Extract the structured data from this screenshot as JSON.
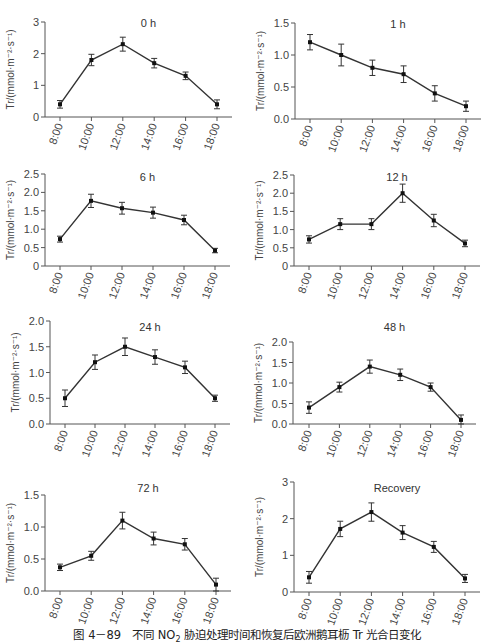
{
  "caption": {
    "prefix": "图 4－89",
    "text_before_sub": "不同 NO",
    "sub": "2",
    "text_after_sub": " 胁迫处理时间和恢复后欧洲鹅耳枥 Tr 光合日变化"
  },
  "style": {
    "line_color": "#333333",
    "axis_color": "#555555",
    "tick_label_color": "#444444"
  },
  "chart_data": [
    {
      "type": "line",
      "title": "0 h",
      "xlabel": "",
      "ylabel": "Tr/(mmol·m⁻²·s⁻¹)",
      "categories": [
        "8:00",
        "10:00",
        "12:00",
        "14:00",
        "16:00",
        "18:00"
      ],
      "values": [
        0.4,
        1.8,
        2.3,
        1.7,
        1.3,
        0.4
      ],
      "errors": [
        0.12,
        0.18,
        0.22,
        0.15,
        0.12,
        0.14
      ],
      "ylim": [
        0,
        3
      ],
      "yticks": [
        "0",
        "1",
        "2",
        "3"
      ],
      "grid": false
    },
    {
      "type": "line",
      "title": "1 h",
      "xlabel": "",
      "ylabel": "Tr/(mmol·m⁻²·s⁻¹)",
      "categories": [
        "8:00",
        "10:00",
        "12:00",
        "14:00",
        "16:00",
        "18:00"
      ],
      "values": [
        1.2,
        1.0,
        0.8,
        0.7,
        0.4,
        0.2
      ],
      "errors": [
        0.12,
        0.17,
        0.12,
        0.13,
        0.12,
        0.08
      ],
      "ylim": [
        0,
        1.5
      ],
      "yticks": [
        "0.0",
        "0.5",
        "1.0",
        "1.5"
      ],
      "grid": false
    },
    {
      "type": "line",
      "title": "6 h",
      "xlabel": "",
      "ylabel": "Tr/(mmol·m⁻²·s⁻¹)",
      "categories": [
        "8:00",
        "10:00",
        "12:00",
        "14:00",
        "16:00",
        "18:00"
      ],
      "values": [
        0.73,
        1.77,
        1.57,
        1.45,
        1.25,
        0.42
      ],
      "errors": [
        0.08,
        0.18,
        0.16,
        0.15,
        0.13,
        0.06
      ],
      "ylim": [
        0,
        2.5
      ],
      "yticks": [
        "0",
        "0.5",
        "1.0",
        "1.5",
        "2.0",
        "2.5"
      ],
      "grid": false
    },
    {
      "type": "line",
      "title": "12 h",
      "xlabel": "",
      "ylabel": "Tr/(mmol·m⁻²·s⁻¹)",
      "categories": [
        "8:00",
        "10:00",
        "12:00",
        "14:00",
        "16:00",
        "18:00"
      ],
      "values": [
        0.73,
        1.15,
        1.15,
        2.0,
        1.25,
        0.62
      ],
      "errors": [
        0.1,
        0.15,
        0.15,
        0.25,
        0.17,
        0.09
      ],
      "ylim": [
        0,
        2.5
      ],
      "yticks": [
        "0",
        "0.5",
        "1.0",
        "1.5",
        "2.0",
        "2.5"
      ],
      "grid": false
    },
    {
      "type": "line",
      "title": "24 h",
      "xlabel": "",
      "ylabel": "Tr/(mmol·m⁻²·s⁻¹)",
      "categories": [
        "8:00",
        "10:00",
        "12:00",
        "14:00",
        "16:00",
        "18:00"
      ],
      "values": [
        0.5,
        1.2,
        1.5,
        1.3,
        1.1,
        0.5
      ],
      "errors": [
        0.16,
        0.14,
        0.17,
        0.14,
        0.12,
        0.06
      ],
      "ylim": [
        0,
        2.0
      ],
      "yticks": [
        "0.0",
        "0.5",
        "1.0",
        "1.5",
        "2.0"
      ],
      "grid": false
    },
    {
      "type": "line",
      "title": "48 h",
      "xlabel": "",
      "ylabel": "Tr/(mmol·m⁻²·s⁻¹)",
      "categories": [
        "8:00",
        "10:00",
        "12:00",
        "14:00",
        "16:00",
        "18:00"
      ],
      "values": [
        0.4,
        0.9,
        1.4,
        1.2,
        0.9,
        0.1
      ],
      "errors": [
        0.14,
        0.12,
        0.16,
        0.14,
        0.1,
        0.12
      ],
      "ylim": [
        0,
        2.0
      ],
      "yticks": [
        "0.0",
        "0.5",
        "1.0",
        "1.5",
        "2.0"
      ],
      "grid": false
    },
    {
      "type": "line",
      "title": "72 h",
      "xlabel": "",
      "ylabel": "Tr/(mmol·m⁻²·s⁻¹)",
      "categories": [
        "8:00",
        "10:00",
        "12:00",
        "14:00",
        "16:00",
        "18:00"
      ],
      "values": [
        0.37,
        0.55,
        1.1,
        0.82,
        0.73,
        0.1
      ],
      "errors": [
        0.05,
        0.07,
        0.13,
        0.1,
        0.09,
        0.1
      ],
      "ylim": [
        0,
        1.5
      ],
      "yticks": [
        "0.0",
        "0.5",
        "1.0",
        "1.5"
      ],
      "grid": false
    },
    {
      "type": "line",
      "title": "Recovery",
      "xlabel": "",
      "ylabel": "Tr/(mmol·m⁻²·s⁻¹)",
      "categories": [
        "8:00",
        "10:00",
        "12:00",
        "14:00",
        "16:00",
        "18:00"
      ],
      "values": [
        0.4,
        1.72,
        2.18,
        1.62,
        1.23,
        0.37
      ],
      "errors": [
        0.16,
        0.21,
        0.25,
        0.19,
        0.15,
        0.11
      ],
      "ylim": [
        0,
        3
      ],
      "yticks": [
        "0",
        "1",
        "2",
        "3"
      ],
      "grid": false
    }
  ],
  "layout": {
    "panels": [
      {
        "ax": 45,
        "xFirst": 60,
        "xLast": 217,
        "xEnd": 232,
        "yTop": 22,
        "yBottom": 117,
        "titleY": 27
      },
      {
        "ax": 295,
        "xFirst": 310,
        "xLast": 466,
        "xEnd": 481,
        "yTop": 23,
        "yBottom": 119,
        "titleY": 28
      },
      {
        "ax": 45,
        "xFirst": 60,
        "xLast": 215,
        "xEnd": 230,
        "yTop": 174,
        "yBottom": 266,
        "titleY": 181
      },
      {
        "ax": 294,
        "xFirst": 309,
        "xLast": 465,
        "xEnd": 480,
        "yTop": 175,
        "yBottom": 266,
        "titleY": 181
      },
      {
        "ax": 50,
        "xFirst": 65,
        "xLast": 215,
        "xEnd": 230,
        "yTop": 321,
        "yBottom": 424,
        "titleY": 331
      },
      {
        "ax": 293,
        "xFirst": 309,
        "xLast": 461,
        "xEnd": 476,
        "yTop": 342,
        "yBottom": 424,
        "titleY": 331
      },
      {
        "ax": 45,
        "xFirst": 60,
        "xLast": 216,
        "xEnd": 231,
        "yTop": 495,
        "yBottom": 591,
        "titleY": 492
      },
      {
        "ax": 294,
        "xFirst": 309,
        "xLast": 465,
        "xEnd": 480,
        "yTop": 482,
        "yBottom": 592,
        "titleY": 492
      }
    ]
  }
}
